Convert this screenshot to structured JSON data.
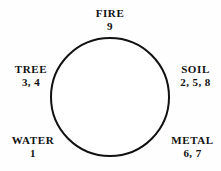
{
  "diagram": {
    "type": "cycle-circle",
    "shape": {
      "name": "circle-outline",
      "center_x": 110,
      "center_y": 97,
      "radius": 59,
      "stroke_color": "#111111",
      "stroke_width": 2,
      "fill_color": "#ffffff"
    },
    "background_color": "#fefefe",
    "nodes": [
      {
        "id": "fire",
        "name": "FIRE",
        "values": "9",
        "position": "top"
      },
      {
        "id": "tree",
        "name": "TREE",
        "values": "3, 4",
        "position": "left"
      },
      {
        "id": "soil",
        "name": "SOIL",
        "values": "2, 5, 8",
        "position": "right"
      },
      {
        "id": "water",
        "name": "WATER",
        "values": "1",
        "position": "bottom-left"
      },
      {
        "id": "metal",
        "name": "METAL",
        "values": "6, 7",
        "position": "bottom-right"
      }
    ]
  }
}
